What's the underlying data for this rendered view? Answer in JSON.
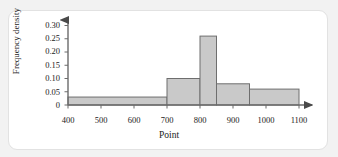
{
  "chart_data": {
    "type": "bar",
    "title": "",
    "xlabel": "Point",
    "ylabel": "Frequency density",
    "xlim": [
      400,
      1100
    ],
    "ylim": [
      0,
      0.325
    ],
    "grid": false,
    "legend": null,
    "xticks": [
      "400",
      "500",
      "600",
      "700",
      "800",
      "900",
      "1000",
      "1100"
    ],
    "xtick_values": [
      400,
      500,
      600,
      700,
      800,
      900,
      1000,
      1100
    ],
    "yticks": [
      "0",
      "0.05",
      "0.10",
      "0.15",
      "0.20",
      "0.25",
      "0.30"
    ],
    "ytick_values": [
      0,
      0.05,
      0.1,
      0.15,
      0.2,
      0.25,
      0.3
    ],
    "bin_edges": [
      400,
      700,
      800,
      850,
      950,
      1100
    ],
    "values": [
      0.03,
      0.1,
      0.26,
      0.08,
      0.06
    ],
    "bars": [
      {
        "x0": 400,
        "x1": 700,
        "density": 0.03
      },
      {
        "x0": 700,
        "x1": 800,
        "density": 0.1
      },
      {
        "x0": 800,
        "x1": 850,
        "density": 0.26
      },
      {
        "x0": 850,
        "x1": 950,
        "density": 0.08
      },
      {
        "x0": 950,
        "x1": 1100,
        "density": 0.06
      }
    ],
    "colors": {
      "bar_fill": "#c9c9c9",
      "bar_stroke": "#6e6e6e",
      "axis": "#6b6b6b",
      "text": "#1b1b1b",
      "card": "#ffffff",
      "page_background": "#f2f2f2"
    }
  }
}
